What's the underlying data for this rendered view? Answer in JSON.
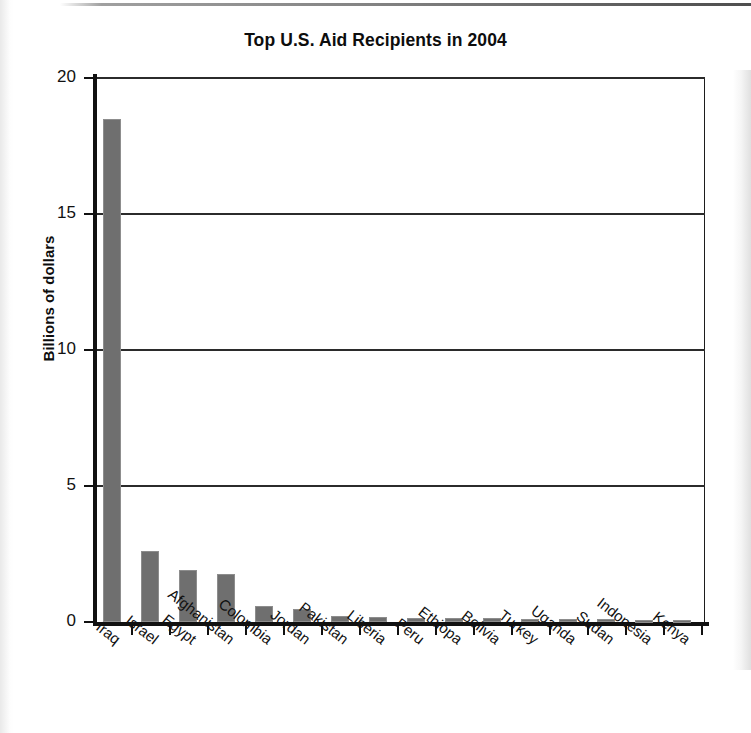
{
  "chart_data": {
    "type": "bar",
    "title": "Top U.S. Aid Recipients in 2004",
    "xlabel": "",
    "ylabel": "Billions of dollars",
    "ylim": [
      0,
      20
    ],
    "yticks": [
      0,
      5,
      10,
      15,
      20
    ],
    "ytick_labels": [
      "0",
      "5",
      "10",
      "15",
      "20"
    ],
    "grid": true,
    "grid_axis": "y",
    "legend": false,
    "bar_color": "#6f6f6f",
    "categories": [
      "Iraq",
      "Israel",
      "Egypt",
      "Afghanistan",
      "Colombia",
      "Jordan",
      "Pakistan",
      "Liberia",
      "Peru",
      "Ethiopa",
      "Bolivia",
      "Turkey",
      "Uganda",
      "Sudan",
      "Indonesia",
      "Kenya"
    ],
    "values": [
      18.5,
      2.6,
      1.9,
      1.75,
      0.57,
      0.48,
      0.21,
      0.19,
      0.16,
      0.14,
      0.13,
      0.12,
      0.11,
      0.1,
      0.09,
      0.08
    ]
  }
}
